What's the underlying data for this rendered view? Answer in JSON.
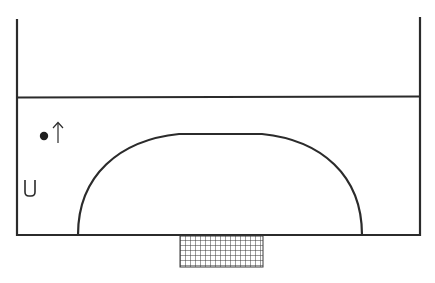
{
  "diagram": {
    "type": "sports-court-half",
    "colors": {
      "line": "#2b2b2b",
      "background": "#ffffff",
      "net": "#3a3a3a"
    },
    "court": {
      "left_x": 17,
      "right_x": 420,
      "top_y": 19,
      "bottom_y": 235,
      "halfway_line_y": 97
    },
    "goal_area_arc": {
      "start_x": 78,
      "end_x": 362,
      "base_y": 235,
      "flat_start_x": 179,
      "flat_end_x": 262,
      "peak_y": 134
    },
    "goal_net": {
      "x": 180,
      "y": 235,
      "width": 83,
      "height": 32,
      "cell": 5
    },
    "symbols": [
      {
        "name": "player-dot",
        "glyph": "●",
        "x": 44,
        "y": 136
      },
      {
        "name": "direction-arrow",
        "glyph": "↑",
        "x": 58,
        "y": 122
      },
      {
        "name": "cone-marker",
        "glyph": "U",
        "x": 24,
        "y": 180
      }
    ]
  }
}
